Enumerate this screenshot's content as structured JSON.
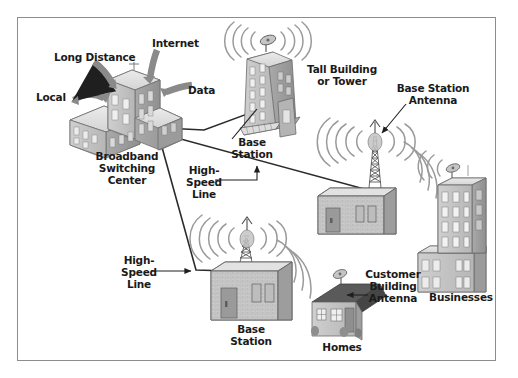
{
  "diagram": {
    "frame_color": "#8d8d8d",
    "background": "#ffffff",
    "text_color": "#1a1a1a",
    "arrow_color": "#8a8a8a",
    "line_color": "#2b2b2b",
    "wave_color": "#9a9a9a"
  },
  "inputs": {
    "local": "Local",
    "long_distance": "Long Distance",
    "internet": "Internet",
    "data": "Data"
  },
  "nodes": {
    "switching_center": "Broadband\nSwitching\nCenter",
    "tall_building": "Tall Building\nor Tower",
    "base_station_tower": "Base\nStation",
    "base_station_mid": "Base\nStation",
    "base_station_bottom": "Base\nStation",
    "businesses": "Businesses",
    "homes": "Homes"
  },
  "annotations": {
    "base_station_antenna": "Base Station\nAntenna",
    "customer_building_antenna": "Customer\nBuilding\nAntenna",
    "high_speed_line_upper": "High-\nSpeed\nLine",
    "high_speed_line_lower": "High-\nSpeed\nLine"
  },
  "icons": {
    "dish_antenna": "dish-antenna-icon",
    "lattice_tower": "lattice-tower-icon",
    "radio_waves": "radio-waves-icon",
    "office_building": "office-building-icon",
    "house": "house-icon",
    "curved_arrow": "curved-arrow-icon"
  }
}
